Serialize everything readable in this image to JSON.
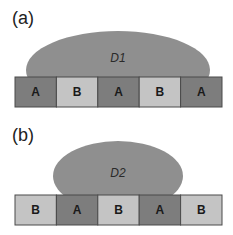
{
  "colors": {
    "A": "#7d7d7d",
    "B": "#c4c4c4",
    "drop": "#8f8f8f",
    "border": "#4a4a4a"
  },
  "panels": [
    {
      "label": "(a)",
      "drop_label": "D1",
      "cells": [
        "A",
        "B",
        "A",
        "B",
        "A"
      ]
    },
    {
      "label": "(b)",
      "drop_label": "D2",
      "cells": [
        "B",
        "A",
        "B",
        "A",
        "B"
      ]
    }
  ]
}
